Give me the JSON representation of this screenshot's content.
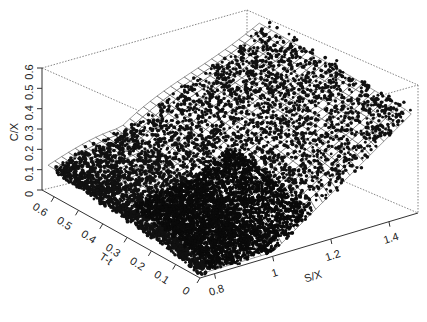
{
  "chart_data": {
    "type": "scatter3d",
    "title": "",
    "axes": {
      "z": {
        "label": "C/X",
        "ticks": [
          "0",
          "0.1",
          "0.2",
          "0.3",
          "0.4",
          "0.5",
          "0.6"
        ],
        "range": [
          0,
          0.6
        ]
      },
      "y": {
        "label": "T-t",
        "ticks": [
          "0",
          "0.1",
          "0.2",
          "0.3",
          "0.4",
          "0.5",
          "0.6"
        ],
        "range": [
          0,
          0.65
        ]
      },
      "x": {
        "label": "S/X",
        "ticks": [
          "0.8",
          "1",
          "1.2",
          "1.4"
        ],
        "range": [
          0.75,
          1.5
        ]
      }
    },
    "surface": {
      "style": "wireframe mesh",
      "color": "#000000",
      "fill": "#ffffff"
    },
    "points": {
      "color": "#111111",
      "marker": "filled circle",
      "density": "very dense near S/X 0.8-1.1, sparse at high S/X"
    },
    "box": {
      "style": "dotted",
      "color": "#555555"
    },
    "legend": null,
    "grid": false
  },
  "labels": {
    "z_axis_title": "C/X",
    "y_axis_title": "T-t",
    "x_axis_title": "S/X",
    "z_ticks": [
      "0",
      "0.1",
      "0.2",
      "0.3",
      "0.4",
      "0.5",
      "0.6"
    ],
    "y_ticks": [
      "0.6",
      "0.5",
      "0.4",
      "0.3",
      "0.2",
      "0.1",
      "0"
    ],
    "x_ticks": [
      "0.8",
      "1",
      "1.2",
      "1.4"
    ]
  }
}
